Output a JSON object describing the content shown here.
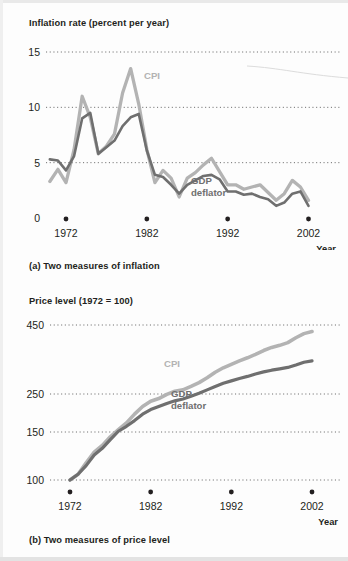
{
  "figure": {
    "panels": [
      {
        "id": "a",
        "axis_title": "Inflation rate (percent per year)",
        "caption": "(a) Two measures of inflation",
        "xaxis_name": "Year"
      },
      {
        "id": "b",
        "axis_title": "Price level (1972 = 100)",
        "caption": "(b) Two measures of price level",
        "xaxis_name": "Year"
      }
    ]
  },
  "colors": {
    "cpi": "#b3b3b3",
    "deflator": "#6f6f6f",
    "gridline": "#6f6f6f",
    "text": "#231f20",
    "background": "#fdfdfd"
  },
  "labels": {
    "cpi": "CPI",
    "gdp": "GDP",
    "deflator": "deflator",
    "gdp_deflator": "GDP deflator"
  },
  "chart_data": [
    {
      "type": "line",
      "id": "inflation",
      "title": "Inflation rate (percent per year)",
      "subtitle": "(a) Two measures of inflation",
      "xlabel": "Year",
      "ylabel": "Inflation rate (percent per year)",
      "xlim": [
        1970,
        2003
      ],
      "ylim": [
        0,
        15
      ],
      "yticks": [
        0,
        5,
        10,
        15
      ],
      "xticks": [
        1972,
        1982,
        1992,
        2002
      ],
      "grid": "horizontal-dotted",
      "legend": "inline-annotation",
      "x": [
        1970,
        1971,
        1972,
        1973,
        1974,
        1975,
        1976,
        1977,
        1978,
        1979,
        1980,
        1981,
        1982,
        1983,
        1984,
        1985,
        1986,
        1987,
        1988,
        1989,
        1990,
        1991,
        1992,
        1993,
        1994,
        1995,
        1996,
        1997,
        1998,
        1999,
        2000,
        2001,
        2002
      ],
      "series": [
        {
          "name": "CPI",
          "color": "#b3b3b3",
          "values": [
            3.3,
            4.4,
            3.2,
            6.2,
            11.0,
            9.1,
            5.8,
            6.5,
            7.6,
            11.3,
            13.5,
            10.3,
            6.2,
            3.2,
            4.3,
            3.6,
            1.9,
            3.6,
            4.1,
            4.8,
            5.4,
            4.2,
            3.0,
            3.0,
            2.6,
            2.8,
            3.0,
            2.3,
            1.6,
            2.2,
            3.4,
            2.8,
            1.6
          ]
        },
        {
          "name": "GDP deflator",
          "color": "#6f6f6f",
          "values": [
            5.3,
            5.2,
            4.3,
            5.6,
            9.0,
            9.5,
            5.8,
            6.4,
            7.0,
            8.3,
            9.1,
            9.4,
            6.1,
            3.9,
            3.7,
            3.0,
            2.2,
            3.0,
            3.4,
            3.8,
            3.9,
            3.5,
            2.4,
            2.4,
            2.1,
            2.2,
            1.9,
            1.7,
            1.1,
            1.4,
            2.2,
            2.4,
            1.1
          ]
        }
      ]
    },
    {
      "type": "line",
      "id": "price-level",
      "title": "Price level (1972 = 100)",
      "subtitle": "(b) Two measures of price level",
      "xlabel": "Year",
      "ylabel": "Price level (1972 = 100)",
      "xlim": [
        1971,
        2003
      ],
      "ylim": [
        100,
        480
      ],
      "yticks": [
        100,
        150,
        250,
        450
      ],
      "xticks": [
        1972,
        1982,
        1992,
        2002
      ],
      "grid": "horizontal-dotted",
      "legend": "inline-annotation",
      "x": [
        1972,
        1973,
        1974,
        1975,
        1976,
        1977,
        1978,
        1979,
        1980,
        1981,
        1982,
        1983,
        1984,
        1985,
        1986,
        1987,
        1988,
        1989,
        1990,
        1991,
        1992,
        1993,
        1994,
        1995,
        1996,
        1997,
        1998,
        1999,
        2000,
        2001,
        2002
      ],
      "series": [
        {
          "name": "CPI",
          "color": "#b3b3b3",
          "values": [
            100,
            106,
            118,
            129,
            136,
            145,
            156,
            174,
            197,
            217,
            231,
            238,
            249,
            258,
            262,
            272,
            283,
            297,
            313,
            326,
            336,
            346,
            355,
            365,
            376,
            385,
            391,
            399,
            413,
            425,
            431
          ]
        },
        {
          "name": "GDP deflator",
          "color": "#6f6f6f",
          "values": [
            100,
            106,
            115,
            126,
            133,
            142,
            152,
            165,
            180,
            197,
            209,
            217,
            225,
            232,
            237,
            244,
            252,
            262,
            272,
            281,
            288,
            295,
            301,
            308,
            314,
            319,
            323,
            327,
            334,
            342,
            346
          ]
        }
      ]
    }
  ]
}
